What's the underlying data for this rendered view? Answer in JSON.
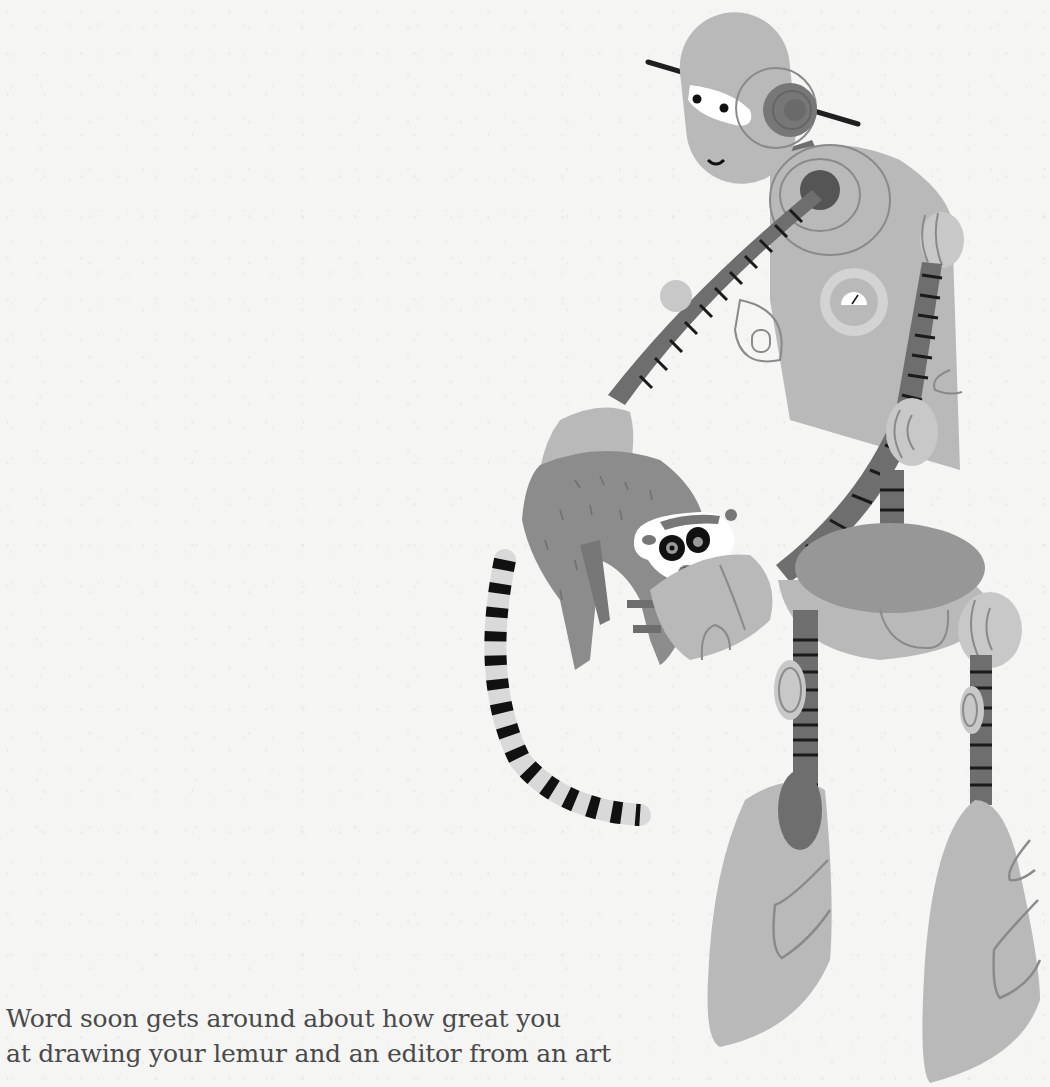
{
  "page": {
    "story_lines": [
      "Word soon gets around about how great you",
      "at drawing your lemur and an editor from an art"
    ]
  },
  "illustration": {
    "subject": "robot holding a ring-tailed lemur",
    "colors": {
      "background": "#f5f5f4",
      "robot_body": "#b9b9b9",
      "robot_outline": "#8a8a8a",
      "joint_dark": "#6e6e6e",
      "stripe": "#1a1a1a",
      "lemur_fur": "#8c8c8c",
      "lemur_face": "#ffffff",
      "text": "#4a4a4a"
    }
  }
}
